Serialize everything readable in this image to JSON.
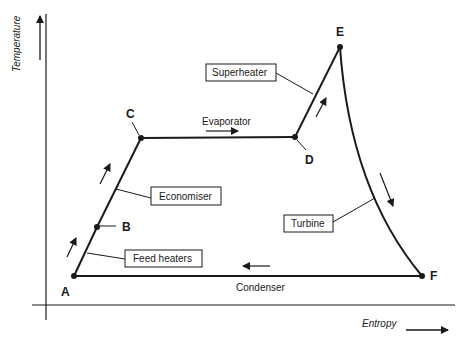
{
  "diagram": {
    "type": "temperature-entropy cycle",
    "axes": {
      "y_label": "Temperature",
      "x_label": "Entropy"
    },
    "points": {
      "A": "A",
      "B": "B",
      "C": "C",
      "D": "D",
      "E": "E",
      "F": "F"
    },
    "labels": {
      "superheater": "Superheater",
      "evaporator": "Evaporator",
      "economiser": "Economiser",
      "feed_heaters": "Feed heaters",
      "turbine": "Turbine",
      "condenser": "Condenser"
    },
    "colors": {
      "line": "#1a1a1a",
      "background": "#ffffff"
    }
  }
}
